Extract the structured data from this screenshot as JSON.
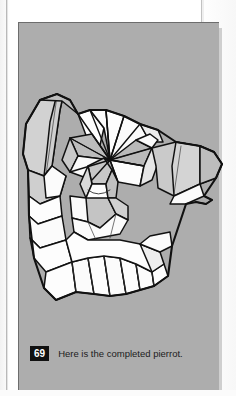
{
  "page": {
    "background_color": "#fdfdfd",
    "gutter_line_color": "#b9b9b9"
  },
  "figure_panel": {
    "background_color": "#adadad",
    "border_color": "#6d6d6d",
    "shadow_color": "#cfcfcf",
    "alt": "Origami pierrot figure, completed, shown as a polygonal folded-paper line drawing"
  },
  "caption": {
    "number": "69",
    "text": "Here is the completed pierrot.",
    "badge_background": "#111111",
    "badge_text_color": "#ffffff",
    "text_color": "#1c1c1c"
  },
  "artwork": {
    "name": "pierrot-origami",
    "stroke_color": "#111111",
    "facet_fill_light": "#d6d6d6",
    "facet_fill_white": "#fdfdfd",
    "facet_fill_mid": "#c4c4c4",
    "facet_fill_shade": "#9d9d9d",
    "thin_crease_color": "#3a3a3a"
  }
}
